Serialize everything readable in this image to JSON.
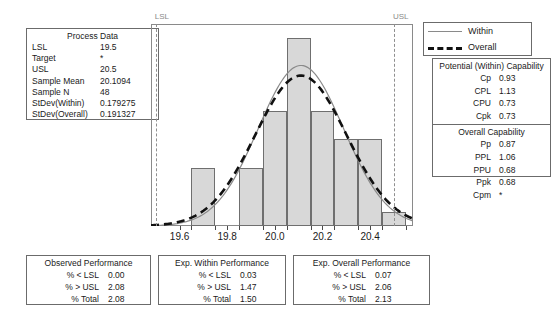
{
  "process_data": {
    "title": "Process Data",
    "rows": [
      {
        "label": "LSL",
        "value": "19.5"
      },
      {
        "label": "Target",
        "value": "*"
      },
      {
        "label": "USL",
        "value": "20.5"
      },
      {
        "label": "Sample Mean",
        "value": "20.1094"
      },
      {
        "label": "Sample N",
        "value": "48"
      },
      {
        "label": "StDev(Within)",
        "value": "0.179275"
      },
      {
        "label": "StDev(Overall)",
        "value": "0.191327"
      }
    ]
  },
  "legend": {
    "items": [
      {
        "label": "Within",
        "style": "solid",
        "color": "#8a8a8a"
      },
      {
        "label": "Overall",
        "style": "dashed",
        "color": "#111111"
      }
    ]
  },
  "capability": {
    "within_title": "Potential (Within) Capability",
    "within_rows": [
      {
        "label": "Cp",
        "value": "0.93"
      },
      {
        "label": "CPL",
        "value": "1.13"
      },
      {
        "label": "CPU",
        "value": "0.73"
      },
      {
        "label": "Cpk",
        "value": "0.73"
      }
    ],
    "overall_title": "Overall Capability",
    "overall_rows": [
      {
        "label": "Pp",
        "value": "0.87"
      },
      {
        "label": "PPL",
        "value": "1.06"
      },
      {
        "label": "PPU",
        "value": "0.68"
      },
      {
        "label": "Ppk",
        "value": "0.68"
      },
      {
        "label": "Cpm",
        "value": "*"
      }
    ]
  },
  "observed_performance": {
    "title": "Observed Performance",
    "rows": [
      {
        "label": "% < LSL",
        "value": "0.00"
      },
      {
        "label": "% > USL",
        "value": "2.08"
      },
      {
        "label": "% Total",
        "value": "2.08"
      }
    ]
  },
  "exp_within_performance": {
    "title": "Exp. Within Performance",
    "rows": [
      {
        "label": "% < LSL",
        "value": "0.03"
      },
      {
        "label": "% > USL",
        "value": "1.47"
      },
      {
        "label": "% Total",
        "value": "1.50"
      }
    ]
  },
  "exp_overall_performance": {
    "title": "Exp. Overall Performance",
    "rows": [
      {
        "label": "% < LSL",
        "value": "0.07"
      },
      {
        "label": "% > USL",
        "value": "2.06"
      },
      {
        "label": "% Total",
        "value": "2.13"
      }
    ]
  },
  "chart_data": {
    "type": "bar",
    "title": "",
    "xlabel": "",
    "ylabel": "",
    "xlim": [
      19.48,
      20.58
    ],
    "ylim": [
      0,
      14
    ],
    "grid": false,
    "legend_position": "top-right",
    "tick_labels": [
      "19.6",
      "19.8",
      "20.0",
      "20.2",
      "20.4"
    ],
    "tick_values": [
      19.6,
      19.8,
      20.0,
      20.2,
      20.4
    ],
    "bin_width": 0.1,
    "bin_edges": [
      19.65,
      19.75,
      19.85,
      19.95,
      20.05,
      20.15,
      20.25,
      20.35,
      20.45,
      20.55
    ],
    "bin_centers": [
      19.7,
      19.8,
      19.9,
      20.0,
      20.1,
      20.2,
      20.3,
      20.4,
      20.5
    ],
    "values": [
      4,
      0,
      4,
      8,
      13,
      8,
      6,
      6,
      1
    ],
    "reference_lines": [
      {
        "name": "LSL",
        "label": "LSL",
        "value": 19.5,
        "style": "dashed",
        "color": "#8f8f8f"
      },
      {
        "name": "USL",
        "label": "USL",
        "value": 20.5,
        "style": "dashed",
        "color": "#8f8f8f"
      }
    ],
    "series": [
      {
        "name": "Within",
        "type": "normal-curve",
        "mean": 20.1094,
        "sd": 0.179275,
        "style": "solid",
        "color": "#8a8a8a"
      },
      {
        "name": "Overall",
        "type": "normal-curve",
        "mean": 20.1094,
        "sd": 0.191327,
        "style": "dashed",
        "color": "#111111"
      }
    ]
  }
}
